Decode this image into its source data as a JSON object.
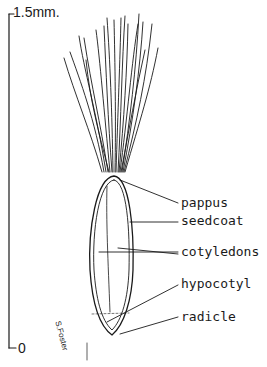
{
  "scale_bar": {
    "top_label": "1.5mm.",
    "bottom_label": "0"
  },
  "labels": {
    "pappus": "pappus",
    "seedcoat": "seedcoat",
    "cotyledons": "cotyledons",
    "hypocotyl": "hypocotyl",
    "radicle": "radicle"
  },
  "signature": "S.Foster",
  "colors": {
    "ink": "#1a1a1a",
    "background": "#ffffff"
  }
}
